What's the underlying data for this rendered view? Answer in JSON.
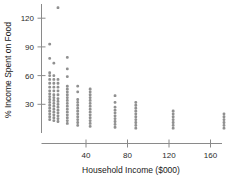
{
  "chart_data": {
    "type": "scatter",
    "title": "",
    "xlabel": "Household Income ($000)",
    "ylabel": "% Income Spent on Food",
    "xlim": [
      0,
      185
    ],
    "ylim": [
      0,
      140
    ],
    "xticks": [
      40,
      80,
      120,
      160
    ],
    "xtick_labels": [
      "40",
      "80",
      "120",
      "160"
    ],
    "yticks": [
      30,
      60,
      90,
      120
    ],
    "ytick_labels": [
      "30",
      "60",
      "90",
      "120"
    ],
    "grid": false,
    "legend": null,
    "marker_color": "#909090",
    "axis_color": "#8a8a8a",
    "points": [
      {
        "x": 5,
        "y": 14
      },
      {
        "x": 5,
        "y": 17
      },
      {
        "x": 5,
        "y": 20
      },
      {
        "x": 5,
        "y": 23
      },
      {
        "x": 5,
        "y": 26
      },
      {
        "x": 5,
        "y": 29
      },
      {
        "x": 5,
        "y": 32
      },
      {
        "x": 5,
        "y": 35
      },
      {
        "x": 5,
        "y": 38
      },
      {
        "x": 5,
        "y": 41
      },
      {
        "x": 5,
        "y": 44
      },
      {
        "x": 5,
        "y": 48
      },
      {
        "x": 5,
        "y": 52
      },
      {
        "x": 5,
        "y": 56
      },
      {
        "x": 5,
        "y": 60
      },
      {
        "x": 5,
        "y": 63
      },
      {
        "x": 5,
        "y": 78
      },
      {
        "x": 5,
        "y": 93
      },
      {
        "x": 9,
        "y": 13
      },
      {
        "x": 9,
        "y": 16
      },
      {
        "x": 9,
        "y": 19
      },
      {
        "x": 9,
        "y": 22
      },
      {
        "x": 9,
        "y": 25
      },
      {
        "x": 9,
        "y": 28
      },
      {
        "x": 9,
        "y": 31
      },
      {
        "x": 9,
        "y": 34
      },
      {
        "x": 9,
        "y": 37
      },
      {
        "x": 9,
        "y": 40
      },
      {
        "x": 9,
        "y": 44
      },
      {
        "x": 9,
        "y": 48
      },
      {
        "x": 9,
        "y": 52
      },
      {
        "x": 9,
        "y": 56
      },
      {
        "x": 9,
        "y": 60
      },
      {
        "x": 9,
        "y": 73
      },
      {
        "x": 13,
        "y": 12
      },
      {
        "x": 13,
        "y": 15
      },
      {
        "x": 13,
        "y": 18
      },
      {
        "x": 13,
        "y": 21
      },
      {
        "x": 13,
        "y": 24
      },
      {
        "x": 13,
        "y": 27
      },
      {
        "x": 13,
        "y": 30
      },
      {
        "x": 13,
        "y": 33
      },
      {
        "x": 13,
        "y": 36
      },
      {
        "x": 13,
        "y": 40
      },
      {
        "x": 13,
        "y": 44
      },
      {
        "x": 13,
        "y": 48
      },
      {
        "x": 13,
        "y": 52
      },
      {
        "x": 13,
        "y": 56
      },
      {
        "x": 13,
        "y": 131
      },
      {
        "x": 22,
        "y": 10
      },
      {
        "x": 22,
        "y": 13
      },
      {
        "x": 22,
        "y": 16
      },
      {
        "x": 22,
        "y": 19
      },
      {
        "x": 22,
        "y": 22
      },
      {
        "x": 22,
        "y": 25
      },
      {
        "x": 22,
        "y": 28
      },
      {
        "x": 22,
        "y": 31
      },
      {
        "x": 22,
        "y": 34
      },
      {
        "x": 22,
        "y": 37
      },
      {
        "x": 22,
        "y": 40
      },
      {
        "x": 22,
        "y": 43
      },
      {
        "x": 22,
        "y": 46
      },
      {
        "x": 22,
        "y": 49
      },
      {
        "x": 22,
        "y": 59
      },
      {
        "x": 22,
        "y": 67
      },
      {
        "x": 22,
        "y": 79
      },
      {
        "x": 32,
        "y": 8
      },
      {
        "x": 32,
        "y": 11
      },
      {
        "x": 32,
        "y": 14
      },
      {
        "x": 32,
        "y": 17
      },
      {
        "x": 32,
        "y": 20
      },
      {
        "x": 32,
        "y": 23
      },
      {
        "x": 32,
        "y": 26
      },
      {
        "x": 32,
        "y": 29
      },
      {
        "x": 32,
        "y": 32
      },
      {
        "x": 32,
        "y": 35
      },
      {
        "x": 32,
        "y": 43
      },
      {
        "x": 32,
        "y": 49
      },
      {
        "x": 44,
        "y": 7
      },
      {
        "x": 44,
        "y": 10
      },
      {
        "x": 44,
        "y": 13
      },
      {
        "x": 44,
        "y": 16
      },
      {
        "x": 44,
        "y": 19
      },
      {
        "x": 44,
        "y": 22
      },
      {
        "x": 44,
        "y": 25
      },
      {
        "x": 44,
        "y": 28
      },
      {
        "x": 44,
        "y": 31
      },
      {
        "x": 44,
        "y": 34
      },
      {
        "x": 44,
        "y": 37
      },
      {
        "x": 44,
        "y": 40
      },
      {
        "x": 44,
        "y": 43
      },
      {
        "x": 44,
        "y": 46
      },
      {
        "x": 68,
        "y": 6
      },
      {
        "x": 68,
        "y": 9
      },
      {
        "x": 68,
        "y": 12
      },
      {
        "x": 68,
        "y": 15
      },
      {
        "x": 68,
        "y": 18
      },
      {
        "x": 68,
        "y": 21
      },
      {
        "x": 68,
        "y": 24
      },
      {
        "x": 68,
        "y": 27
      },
      {
        "x": 68,
        "y": 32
      },
      {
        "x": 68,
        "y": 39
      },
      {
        "x": 88,
        "y": 5
      },
      {
        "x": 88,
        "y": 8
      },
      {
        "x": 88,
        "y": 11
      },
      {
        "x": 88,
        "y": 14
      },
      {
        "x": 88,
        "y": 17
      },
      {
        "x": 88,
        "y": 20
      },
      {
        "x": 88,
        "y": 23
      },
      {
        "x": 88,
        "y": 26
      },
      {
        "x": 88,
        "y": 29
      },
      {
        "x": 88,
        "y": 32
      },
      {
        "x": 124,
        "y": 5
      },
      {
        "x": 124,
        "y": 8
      },
      {
        "x": 124,
        "y": 11
      },
      {
        "x": 124,
        "y": 14
      },
      {
        "x": 124,
        "y": 17
      },
      {
        "x": 124,
        "y": 20
      },
      {
        "x": 124,
        "y": 23
      },
      {
        "x": 173,
        "y": 5
      },
      {
        "x": 173,
        "y": 8
      },
      {
        "x": 173,
        "y": 11
      },
      {
        "x": 173,
        "y": 14
      },
      {
        "x": 173,
        "y": 17
      },
      {
        "x": 173,
        "y": 20
      }
    ]
  }
}
